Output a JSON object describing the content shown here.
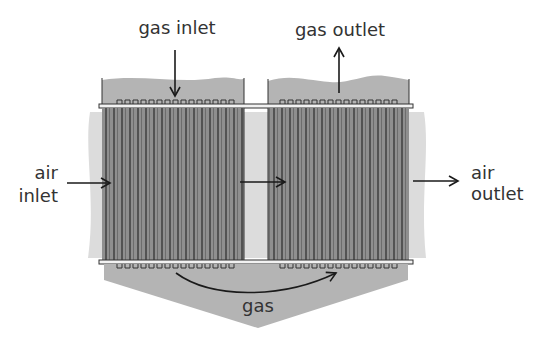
{
  "diagram": {
    "labels": {
      "gas_inlet": "gas inlet",
      "gas_outlet": "gas outlet",
      "air_inlet_line1": "air",
      "air_inlet_line2": "inlet",
      "air_outlet_line1": "air",
      "air_outlet_line2": "outlet",
      "gas_bottom": "gas"
    },
    "colors": {
      "air_band": "#dcdcdc",
      "gas_plenum": "#b4b4b4",
      "tube_bank": "#8c8c8c",
      "tube_line": "#2a2a2a",
      "text": "#333333",
      "arrow": "#1a1a1a"
    },
    "components": [
      {
        "name": "gas-inlet-header",
        "role": "top plenum receiving hot gas"
      },
      {
        "name": "gas-outlet-header",
        "role": "top plenum discharging cooled gas"
      },
      {
        "name": "tube-bank-first-pass",
        "role": "gas flows down through tubes"
      },
      {
        "name": "tube-bank-second-pass",
        "role": "gas flows up through tubes"
      },
      {
        "name": "bottom-hopper",
        "role": "turns gas from first to second pass"
      },
      {
        "name": "air-crossflow",
        "role": "air passes across tube banks left to right"
      }
    ]
  }
}
